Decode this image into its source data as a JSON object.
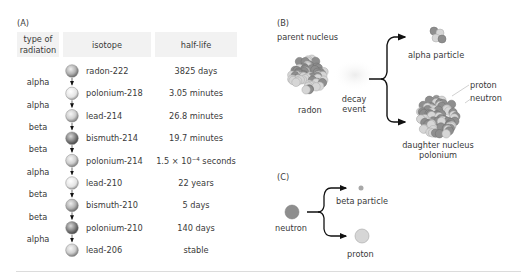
{
  "panel_a": {
    "label": "(A)",
    "headers": {
      "radiation_line1": "type of",
      "radiation_line2": "radiation",
      "isotope": "isotope",
      "half_life": "half-life"
    },
    "isotopes": [
      {
        "name": "radon-222",
        "half_life": "3825 days",
        "shade": "mid"
      },
      {
        "name": "polonium-218",
        "half_life": "3.05 minutes",
        "shade": "light"
      },
      {
        "name": "lead-214",
        "half_life": "26.8 minutes",
        "shade": "mid-light"
      },
      {
        "name": "bismuth-214",
        "half_life": "19.7 minutes",
        "shade": "dark"
      },
      {
        "name": "polonium-214",
        "half_life_base": "1.5 × 10",
        "half_life_exp": "−4",
        "half_life_unit": " seconds",
        "shade": "mid-light"
      },
      {
        "name": "lead-210",
        "half_life": "22 years",
        "shade": "light"
      },
      {
        "name": "bismuth-210",
        "half_life": "5 days",
        "shade": "mid"
      },
      {
        "name": "polonium-210",
        "half_life": "140 days",
        "shade": "dark"
      },
      {
        "name": "lead-206",
        "half_life": "stable",
        "shade": "mid-light"
      }
    ],
    "radiation_types": [
      "alpha",
      "alpha",
      "beta",
      "beta",
      "alpha",
      "beta",
      "beta",
      "alpha"
    ]
  },
  "panel_b": {
    "label": "(B)",
    "parent_label": "parent nucleus",
    "parent_name": "radon",
    "event_line1": "decay",
    "event_line2": "event",
    "alpha_label": "alpha particle",
    "proton_label": "proton",
    "neutron_label": "neutron",
    "daughter_line1": "daughter nucleus",
    "daughter_line2": "polonium"
  },
  "panel_c": {
    "label": "(C)",
    "neutron_label": "neutron",
    "beta_label": "beta particle",
    "proton_label": "proton"
  },
  "colors": {
    "proton": "#d6d6d6",
    "neutron": "#8e8e8e",
    "header_bg": "#f2f2f2",
    "arrow": "#111111"
  }
}
